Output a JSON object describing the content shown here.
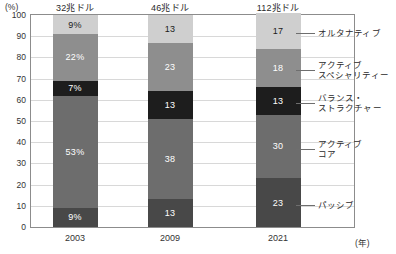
{
  "axis": {
    "y_unit": "(%)",
    "x_unit": "(年)",
    "y_ticks": [
      "100",
      "90",
      "80",
      "70",
      "60",
      "50",
      "40",
      "30",
      "20",
      "10",
      "0"
    ],
    "x_ticks": [
      "2003",
      "2009",
      "2021"
    ]
  },
  "column_headers": [
    "32兆ドル",
    "46兆ドル",
    "112兆ドル"
  ],
  "legend": [
    {
      "label": "オルタナティブ",
      "line2": ""
    },
    {
      "label": "アクティブ",
      "line2": "スペシャリティー"
    },
    {
      "label": "バランス・",
      "line2": "ストラクチャー"
    },
    {
      "label": "アクティブ",
      "line2": "コア"
    },
    {
      "label": "パッシブ",
      "line2": ""
    }
  ],
  "colors": {
    "alternative": "#cfcfcf",
    "active_specialty": "#8e8e8e",
    "balance_structure": "#1d1d1d",
    "active_core": "#6d6d6d",
    "passive": "#484848",
    "gridline": "#d8d8d8",
    "frame": "#8c8c8c"
  },
  "chart_data": {
    "type": "bar",
    "title": "",
    "subtitle": "",
    "xlabel": "(年)",
    "ylabel": "(%)",
    "ylim": [
      0,
      100
    ],
    "grid": true,
    "stacked": true,
    "legend_position": "right",
    "categories": [
      "2003",
      "2009",
      "2021"
    ],
    "category_annotations": [
      "32兆ドル",
      "46兆ドル",
      "112兆ドル"
    ],
    "series": [
      {
        "name": "パッシブ",
        "values": [
          9,
          13,
          23
        ],
        "labels": [
          "9%",
          "13",
          "23"
        ],
        "color": "#484848"
      },
      {
        "name": "アクティブコア",
        "values": [
          53,
          38,
          30
        ],
        "labels": [
          "53%",
          "38",
          "30"
        ],
        "color": "#6d6d6d"
      },
      {
        "name": "バランス・ストラクチャー",
        "values": [
          7,
          13,
          13
        ],
        "labels": [
          "7%",
          "13",
          "13"
        ],
        "color": "#1d1d1d"
      },
      {
        "name": "アクティブスペシャリティー",
        "values": [
          22,
          23,
          18
        ],
        "labels": [
          "22%",
          "23",
          "18"
        ],
        "color": "#8e8e8e"
      },
      {
        "name": "オルタナティブ",
        "values": [
          9,
          13,
          17
        ],
        "labels": [
          "9%",
          "13",
          "17"
        ],
        "color": "#cfcfcf"
      }
    ]
  }
}
